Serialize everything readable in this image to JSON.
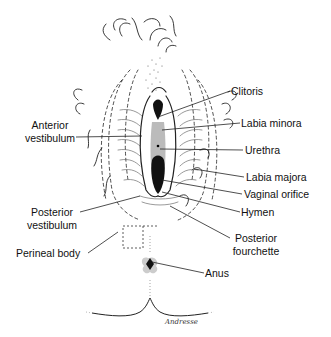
{
  "figure": {
    "type": "anatomical line illustration",
    "signature": "Andresse",
    "labels": [
      {
        "id": "clitoris",
        "text": "Clitoris",
        "side": "right"
      },
      {
        "id": "anterior-vestibulum",
        "line1": "Anterior",
        "line2": "vestibulum",
        "side": "left"
      },
      {
        "id": "labia-minora",
        "text": "Labia minora",
        "side": "right"
      },
      {
        "id": "urethra",
        "text": "Urethra",
        "side": "right"
      },
      {
        "id": "labia-majora",
        "text": "Labia majora",
        "side": "right"
      },
      {
        "id": "vaginal-orifice",
        "text": "Vaginal orifice",
        "side": "right"
      },
      {
        "id": "hymen",
        "text": "Hymen",
        "side": "right"
      },
      {
        "id": "posterior-vestibulum",
        "line1": "Posterior",
        "line2": "vestibulum",
        "side": "left"
      },
      {
        "id": "posterior-fourchette",
        "line1": "Posterior",
        "line2": "fourchette",
        "side": "right"
      },
      {
        "id": "perineal-body",
        "text": "Perineal body",
        "side": "left"
      },
      {
        "id": "anus",
        "text": "Anus",
        "side": "right"
      }
    ]
  }
}
